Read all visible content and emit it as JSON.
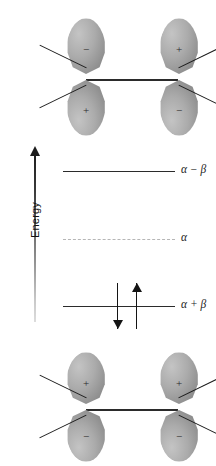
{
  "figure": {
    "kind": "molecular-orbital-energy-diagram",
    "energy_axis": {
      "label": "Energy",
      "direction": "up"
    },
    "levels": [
      {
        "id": "antibonding",
        "label": "α − β",
        "style": "solid",
        "electrons": 0
      },
      {
        "id": "nonbonding",
        "label": "α",
        "style": "dashed",
        "electrons": 0
      },
      {
        "id": "bonding",
        "label": "α + β",
        "style": "solid",
        "electrons": 2
      }
    ],
    "electrons": [
      {
        "name": "electron-down",
        "spin": "down",
        "glyph": "↓"
      },
      {
        "name": "electron-up",
        "spin": "up",
        "glyph": "↑"
      }
    ],
    "orbital_diagrams": [
      {
        "id": "antibonding",
        "caption": "antibonding combination",
        "atoms": [
          {
            "side": "left",
            "top_lobe_sign": "−",
            "bottom_lobe_sign": "+"
          },
          {
            "side": "right",
            "top_lobe_sign": "+",
            "bottom_lobe_sign": "−"
          }
        ]
      },
      {
        "id": "bonding",
        "caption": "bonding combination",
        "atoms": [
          {
            "side": "left",
            "top_lobe_sign": "+",
            "bottom_lobe_sign": "−"
          },
          {
            "side": "right",
            "top_lobe_sign": "+",
            "bottom_lobe_sign": "−"
          }
        ]
      }
    ],
    "colors": {
      "lobe_light": "#c4c4c4",
      "lobe_mid": "#ababab",
      "lobe_dark": "#7e7e7e",
      "line": "#2b2b2b",
      "dashed_line": "#b6b6b6",
      "background": "#ffffff"
    }
  }
}
